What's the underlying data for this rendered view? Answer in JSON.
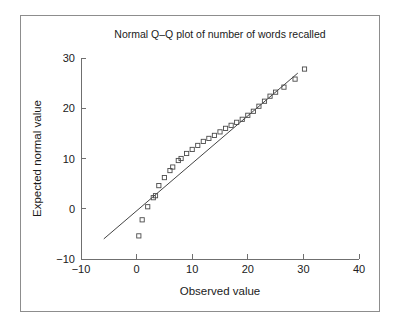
{
  "chart_data": {
    "type": "scatter",
    "title": "Normal Q–Q plot of number of words recalled",
    "xlabel": "Observed value",
    "ylabel": "Expected normal value",
    "xlim": [
      -10,
      40
    ],
    "ylim": [
      -10,
      30
    ],
    "xticks": [
      -10,
      0,
      10,
      20,
      30,
      40
    ],
    "yticks": [
      -10,
      0,
      10,
      20,
      30
    ],
    "xtick_labels": [
      "−10",
      "0",
      "10",
      "20",
      "30",
      "40"
    ],
    "ytick_labels": [
      "−10",
      "0",
      "10",
      "20",
      "30"
    ],
    "grid": false,
    "legend": null,
    "marker": "open-square",
    "marker_color": "#4a4a4a",
    "line_color": "#444444",
    "reference_line": {
      "label": "normal reference line",
      "x_start": -5.9,
      "y_start": -6.0,
      "x_end": 29.0,
      "y_end": 27.0
    },
    "series": [
      {
        "name": "Number of words recalled",
        "x": [
          0.4,
          1.0,
          2.0,
          3.0,
          3.4,
          4.0,
          5.0,
          6.0,
          6.5,
          7.5,
          8.0,
          9.0,
          10.0,
          11.0,
          12.0,
          13.0,
          14.0,
          15.0,
          16.0,
          17.0,
          18.0,
          19.0,
          20.0,
          21.0,
          22.0,
          23.0,
          24.0,
          25.0,
          26.5,
          28.5,
          30.2
        ],
        "y": [
          -5.4,
          -2.2,
          0.4,
          2.2,
          2.6,
          4.6,
          6.2,
          7.6,
          8.3,
          9.6,
          10.0,
          11.0,
          11.8,
          12.6,
          13.4,
          14.0,
          14.6,
          15.3,
          16.0,
          16.6,
          17.2,
          17.8,
          18.6,
          19.4,
          20.4,
          21.4,
          22.4,
          23.2,
          24.2,
          25.8,
          27.8
        ]
      }
    ]
  }
}
